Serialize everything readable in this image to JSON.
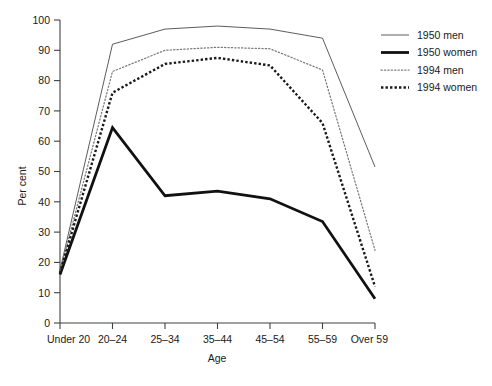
{
  "chart_data": {
    "type": "line",
    "title": "",
    "xlabel": "Age",
    "ylabel": "Per cent",
    "categories": [
      "Under 20",
      "20–24",
      "25–34",
      "35–44",
      "45–54",
      "55–59",
      "Over 59"
    ],
    "xlim_categories": 7,
    "ylim": [
      0,
      100
    ],
    "yticks": [
      0,
      10,
      20,
      30,
      40,
      50,
      60,
      70,
      80,
      90,
      100
    ],
    "grid": false,
    "legend_position": "top-right",
    "series": [
      {
        "name": "1950 men",
        "style": "thin-solid",
        "color": "#4a4a4a",
        "values": [
          17.5,
          92.0,
          97.0,
          98.0,
          97.0,
          94.0,
          51.5
        ]
      },
      {
        "name": "1950 women",
        "style": "thick-solid",
        "color": "#111111",
        "values": [
          16.0,
          64.5,
          42.0,
          43.5,
          41.0,
          33.5,
          8.0
        ]
      },
      {
        "name": "1994 men",
        "style": "fine-dotted",
        "color": "#7a7a7a",
        "values": [
          17.0,
          83.0,
          90.0,
          91.0,
          90.5,
          83.5,
          24.0
        ]
      },
      {
        "name": "1994 women",
        "style": "bold-dotted",
        "color": "#1a1a1a",
        "values": [
          16.5,
          76.0,
          85.5,
          87.5,
          85.0,
          66.0,
          12.0
        ]
      }
    ]
  },
  "axis": {
    "y_tick_labels": [
      "0",
      "10",
      "20",
      "30",
      "40",
      "50",
      "60",
      "70",
      "80",
      "90",
      "100"
    ],
    "x_tick_labels": [
      "Under 20",
      "20–24",
      "25–34",
      "35–44",
      "45–54",
      "55–59",
      "Over 59"
    ],
    "y_title": "Per cent",
    "x_title": "Age"
  },
  "legend": {
    "items": [
      {
        "label": "1950 men"
      },
      {
        "label": "1950 women"
      },
      {
        "label": "1994 men"
      },
      {
        "label": "1994 women"
      }
    ]
  }
}
